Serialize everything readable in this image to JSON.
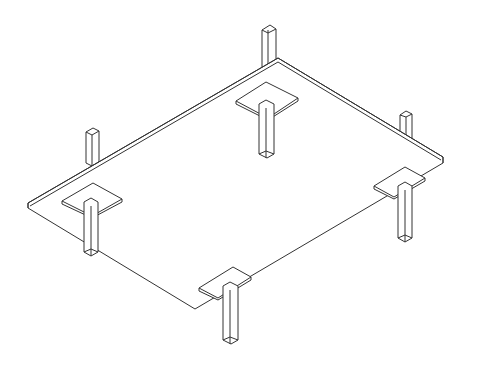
{
  "diagram": {
    "title": "Flat slab with drop panels and columns (isometric)",
    "line_color": "#333333",
    "background": "#ffffff",
    "elements": [
      {
        "id": "slab",
        "type": "flat-slab"
      },
      {
        "id": "column-left",
        "type": "column-with-drop-panel"
      },
      {
        "id": "column-back",
        "type": "column-with-drop-panel"
      },
      {
        "id": "column-right",
        "type": "column-with-drop-panel"
      },
      {
        "id": "column-front",
        "type": "column-with-drop-panel"
      },
      {
        "id": "column-stub-left",
        "type": "upper-column"
      },
      {
        "id": "column-stub-back",
        "type": "upper-column"
      },
      {
        "id": "column-stub-right",
        "type": "upper-column"
      }
    ]
  }
}
